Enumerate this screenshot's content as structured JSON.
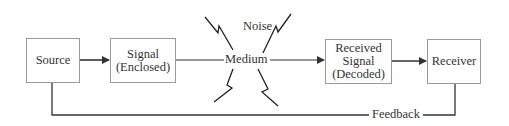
{
  "diagram": {
    "type": "communication-process-flow",
    "nodes": {
      "source": {
        "label": "Source"
      },
      "signal": {
        "line1": "Signal",
        "line2": "(Enclosed)"
      },
      "medium": {
        "label": "Medium"
      },
      "received": {
        "line1": "Received",
        "line2": "Signal",
        "line3": "(Decoded)"
      },
      "receiver": {
        "label": "Receiver"
      }
    },
    "annotations": {
      "noise": "Noise",
      "feedback": "Feedback"
    },
    "edges": [
      {
        "from": "Source",
        "to": "Signal (Enclosed)",
        "arrow": true
      },
      {
        "from": "Signal (Enclosed)",
        "to": "Medium",
        "arrow": false
      },
      {
        "from": "Medium",
        "to": "Received Signal (Decoded)",
        "arrow": true
      },
      {
        "from": "Received Signal (Decoded)",
        "to": "Receiver",
        "arrow": true
      },
      {
        "from": "Receiver",
        "to": "Source",
        "label": "Feedback",
        "arrow": false
      }
    ],
    "colors": {
      "line": "#333333",
      "box_border": "#9a9a9a",
      "text": "#333333"
    }
  }
}
